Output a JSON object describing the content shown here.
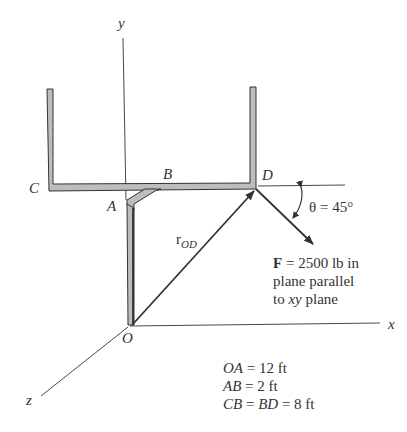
{
  "axes": {
    "x_label": "x",
    "y_label": "y",
    "z_label": "z",
    "origin_label": "O"
  },
  "points": {
    "A": "A",
    "B": "B",
    "C": "C",
    "D": "D"
  },
  "vector_label": {
    "main": "r",
    "subscript": "OD"
  },
  "angle_label": "θ = 45°",
  "force": {
    "symbol": "F",
    "line1_rest": " = 2500 lb in",
    "line2": "plane parallel",
    "line3_prefix": "to ",
    "line3_var": "xy",
    "line3_suffix": " plane"
  },
  "dimensions": [
    {
      "var": "OA",
      "rest": " = 12 ft"
    },
    {
      "var": "AB",
      "rest": " = 2 ft"
    },
    {
      "var1": "CB",
      "mid": " = ",
      "var2": "BD",
      "rest": " = 8 ft"
    }
  ],
  "colors": {
    "bar_fill": "#bdbdbd",
    "line": "#333333"
  }
}
